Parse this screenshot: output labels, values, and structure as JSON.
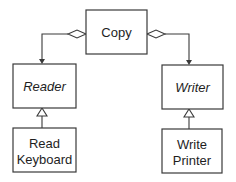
{
  "diagram": {
    "type": "uml-class-diagram",
    "classes": [
      {
        "id": "copy",
        "label": "Copy",
        "italic": false
      },
      {
        "id": "reader",
        "label": "Reader",
        "italic": true
      },
      {
        "id": "writer",
        "label": "Writer",
        "italic": true
      },
      {
        "id": "read_keyboard",
        "label_lines": [
          "Read",
          "Keyboard"
        ],
        "italic": false
      },
      {
        "id": "write_printer",
        "label_lines": [
          "Write",
          "Printer"
        ],
        "italic": false
      }
    ],
    "relationships": [
      {
        "from": "copy",
        "to": "reader",
        "kind": "aggregation"
      },
      {
        "from": "copy",
        "to": "writer",
        "kind": "aggregation"
      },
      {
        "from": "read_keyboard",
        "to": "reader",
        "kind": "generalization"
      },
      {
        "from": "write_printer",
        "to": "writer",
        "kind": "generalization"
      }
    ]
  }
}
